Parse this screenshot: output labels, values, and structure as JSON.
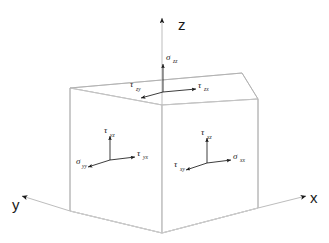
{
  "figure": {
    "type": "stress-tensor-cube-diagram",
    "background_color": "#ffffff",
    "line_color": "#b9b9b9",
    "arrow_color": "#1a1a1a",
    "text_color": "#1a1a1a"
  },
  "axes": [
    {
      "name": "z-axis",
      "label": "z",
      "direction": "up"
    },
    {
      "name": "x-axis",
      "label": "x",
      "direction": "right-down"
    },
    {
      "name": "y-axis",
      "label": "y",
      "direction": "left-down"
    }
  ],
  "faces": [
    {
      "name": "top-face",
      "normal": "z",
      "components": [
        {
          "name": "sigma-zz",
          "symbol": "σ",
          "subscript": "zz",
          "kind": "normal-stress",
          "direction": "up"
        },
        {
          "name": "tau-zx",
          "symbol": "τ",
          "subscript": "zx",
          "kind": "shear-stress",
          "direction": "right"
        },
        {
          "name": "tau-zy",
          "symbol": "τ",
          "subscript": "zy",
          "kind": "shear-stress",
          "direction": "left-down"
        }
      ]
    },
    {
      "name": "left-face",
      "normal": "y",
      "components": [
        {
          "name": "tau-yz",
          "symbol": "τ",
          "subscript": "yz",
          "kind": "shear-stress",
          "direction": "up"
        },
        {
          "name": "tau-yx",
          "symbol": "τ",
          "subscript": "yx",
          "kind": "shear-stress",
          "direction": "right"
        },
        {
          "name": "sigma-yy",
          "symbol": "σ",
          "subscript": "yy",
          "kind": "normal-stress",
          "direction": "left-down"
        }
      ]
    },
    {
      "name": "right-face",
      "normal": "x",
      "components": [
        {
          "name": "tau-xz",
          "symbol": "τ",
          "subscript": "xz",
          "kind": "shear-stress",
          "direction": "up"
        },
        {
          "name": "sigma-xx",
          "symbol": "σ",
          "subscript": "xx",
          "kind": "normal-stress",
          "direction": "right"
        },
        {
          "name": "tau-xy",
          "symbol": "τ",
          "subscript": "xy",
          "kind": "shear-stress",
          "direction": "left-down"
        }
      ]
    }
  ]
}
